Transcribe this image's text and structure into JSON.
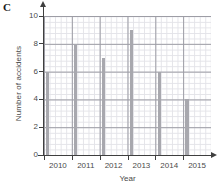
{
  "panel": {
    "letter": "C"
  },
  "chart_data": {
    "type": "bar",
    "title": "",
    "xlabel": "Year",
    "ylabel": "Number of accidents",
    "categories": [
      "2010",
      "2011",
      "2012",
      "2013",
      "2014",
      "2015"
    ],
    "values": [
      6,
      8,
      7,
      9,
      6,
      4
    ],
    "ylim": [
      0,
      10
    ],
    "ytick_labels": [
      "0",
      "2",
      "4",
      "6",
      "8",
      "10"
    ],
    "ytick_values": [
      0,
      2,
      4,
      6,
      8,
      10
    ],
    "xtick_labels": [
      "2010",
      "2011",
      "2012",
      "2013",
      "2014",
      "2015"
    ],
    "grid": true,
    "grid_minor": true,
    "legend": "none",
    "bar_color": "#a8a8ae",
    "axis_color": "#3f3f3f",
    "grid_major_color": "#9c9ca4",
    "grid_minor_color": "#e3e3e8"
  }
}
